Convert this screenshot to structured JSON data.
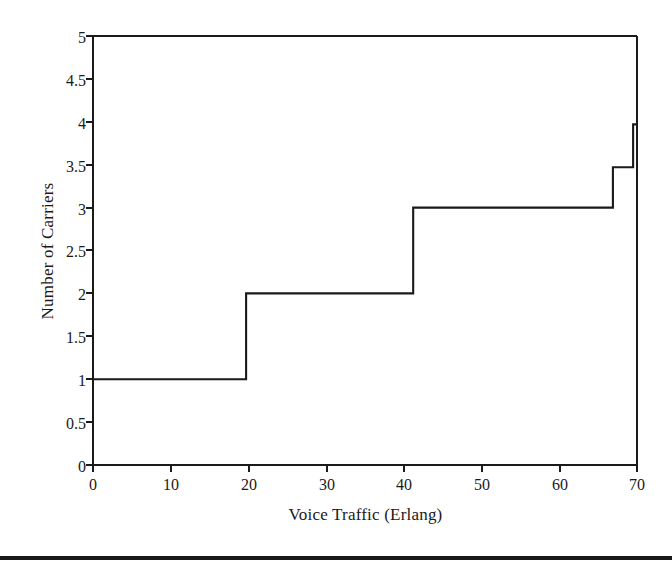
{
  "figure": {
    "background_color": "#ffffff",
    "line_color": "#1a1a1a",
    "axis_color": "#1a1a1a",
    "bottom_rule_color": "#16181a"
  },
  "chart_data": {
    "type": "line",
    "subtype": "step",
    "title": "",
    "subtitle": "",
    "xlabel": "Voice Traffic (Erlang)",
    "ylabel": "Number of Carriers",
    "xlim": [
      0,
      70
    ],
    "ylim": [
      0,
      5
    ],
    "grid": false,
    "legend": null,
    "legend_position": "none",
    "xticks": [
      0,
      10,
      20,
      30,
      40,
      50,
      60,
      70
    ],
    "xtick_labels": [
      "0",
      "10",
      "20",
      "30",
      "40",
      "50",
      "60",
      "70"
    ],
    "yticks": [
      0,
      0.5,
      1,
      1.5,
      2,
      2.5,
      3,
      3.5,
      4,
      4.5,
      5
    ],
    "ytick_labels": [
      "0",
      "0.5",
      "1",
      "1.5",
      "2",
      "2.5",
      "3",
      "3.5",
      "4",
      "4.5",
      "5"
    ],
    "series": [
      {
        "name": "Number of Carriers",
        "step_mode": "post",
        "x": [
          0,
          19.7,
          19.7,
          41.2,
          41.2,
          66.9,
          66.9,
          69.5,
          69.5,
          70
        ],
        "y": [
          1,
          1,
          2,
          2,
          3,
          3,
          3.47,
          3.47,
          3.97,
          3.97
        ]
      }
    ],
    "steps": [
      {
        "x_start": 0,
        "x_end": 19.7,
        "value": 1
      },
      {
        "x_start": 19.7,
        "x_end": 41.2,
        "value": 2
      },
      {
        "x_start": 41.2,
        "x_end": 66.9,
        "value": 3
      },
      {
        "x_start": 66.9,
        "x_end": 69.5,
        "value": 3.47
      },
      {
        "x_start": 69.5,
        "x_end": 70,
        "value": 3.97
      }
    ],
    "annotations": []
  }
}
